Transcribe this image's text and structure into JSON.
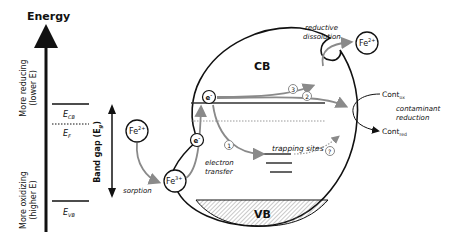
{
  "energy_axis": {
    "title": "Energy",
    "top_label_line1": "More reducing",
    "top_label_line2": "(lower E)",
    "bottom_label_line1": "More oxidizing",
    "bottom_label_line2": "(higher E)"
  },
  "levels": {
    "ecb": "E",
    "ecb_sub": "CB",
    "ef": "E",
    "ef_sub": "F",
    "evb": "E",
    "evb_sub": "VB"
  },
  "band_gap": {
    "label": "Band gap (E",
    "sub": "g",
    "close": ")"
  },
  "particle": {
    "cb": "CB",
    "vb": "VB"
  },
  "species": {
    "fe2_left": "Fe",
    "fe2_left_sup": "2+",
    "fe3": "Fe",
    "fe3_sup": "3+",
    "fe2_right": "Fe",
    "fe2_right_sup": "2+",
    "electron": "e",
    "electron_sup": "-"
  },
  "processes": {
    "sorption": "sorption",
    "electron_transfer_1": "electron",
    "electron_transfer_2": "transfer",
    "reductive_1": "reductive",
    "reductive_2": "dissolution",
    "trapping": "trapping sites",
    "contaminant_1": "contaminant",
    "contaminant_2": "reduction"
  },
  "contaminants": {
    "ox": "Cont",
    "ox_sub": "ox",
    "red": "Cont",
    "red_sub": "red"
  },
  "pathways": {
    "p1": "1",
    "p2": "2",
    "p3": "3",
    "p4": "?"
  },
  "colors": {
    "line": "#111111",
    "arrow_gray": "#8a8a8a",
    "dotted": "#999999",
    "hatch": "#777777"
  }
}
